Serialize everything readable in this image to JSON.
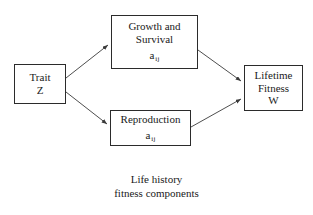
{
  "diagram": {
    "title_caption": {
      "line1": "Life history",
      "line2": "fitness components"
    },
    "nodes": [
      {
        "id": "trait",
        "name": "trait-node",
        "lines": [
          "Trait",
          "Z"
        ],
        "coefficient": null
      },
      {
        "id": "growth",
        "name": "growth-survival-node",
        "lines": [
          "Growth and",
          "Survival"
        ],
        "coefficient": {
          "base": "a",
          "subscript": "ij"
        }
      },
      {
        "id": "reproduction",
        "name": "reproduction-node",
        "lines": [
          "Reproduction"
        ],
        "coefficient": {
          "base": "a",
          "subscript": "ij"
        }
      },
      {
        "id": "fitness",
        "name": "lifetime-fitness-node",
        "lines": [
          "Lifetime",
          "Fitness",
          "W"
        ],
        "coefficient": null
      }
    ],
    "edges": [
      {
        "id": "trait-to-growth",
        "from": "trait",
        "to": "growth",
        "label": ""
      },
      {
        "id": "trait-to-reproduction",
        "from": "trait",
        "to": "reproduction",
        "label": ""
      },
      {
        "id": "growth-to-fitness",
        "from": "growth",
        "to": "fitness",
        "label": ""
      },
      {
        "id": "reproduction-to-fitness",
        "from": "reproduction",
        "to": "fitness",
        "label": ""
      }
    ],
    "colors": {
      "background": "#ffffff",
      "box_border": "#2b2b2b",
      "text": "#1a1a1a",
      "arrow": "#3a3a3a"
    }
  }
}
